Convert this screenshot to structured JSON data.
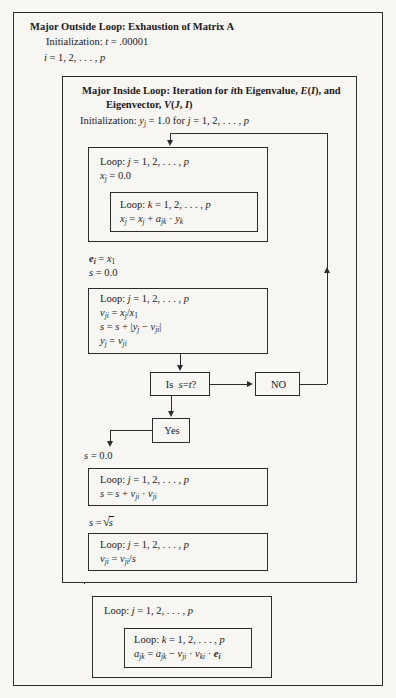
{
  "document": {
    "kind": "algorithm-flowchart",
    "background_color": "#f8f6f3",
    "line_color": "#2c2c2c"
  },
  "outside_loop": {
    "title": "Major Outside Loop: Exhaustion of Matrix A",
    "initialization": "Initialization: t = .00001",
    "index": "i = 1, 2, . . . , p"
  },
  "inside_loop": {
    "title_line1": "Major Inside Loop: Iteration for ith Eigenvalue, E(I), and",
    "title_line2": "Eigenvector, V(J, I)",
    "initialization": "Initialization: yⱼ = 1.0 for j = 1, 2, . . . , p"
  },
  "loop_box_1": {
    "line1": "Loop: j = 1, 2, . . . , p",
    "line2": "xⱼ = 0.0",
    "inner": {
      "line1": "Loop: k = 1, 2, . . . , p",
      "line2": "xⱼ = xⱼ + aⱼₖ · yₖ"
    }
  },
  "equations_after_loop_1": {
    "line1": "eᵢ = x₁",
    "line2": "s = 0.0"
  },
  "loop_box_2": {
    "line1": "Loop: j = 1, 2, . . . , p",
    "line2": "vⱼᵢ = xⱼ/x₁",
    "line3": "s = s + |yⱼ − vⱼᵢ|",
    "line4": "yⱼ = vⱼᵢ"
  },
  "decision": {
    "label_prefix": "Is",
    "label_condition": "s = t?"
  },
  "no_branch": {
    "label": "NO"
  },
  "yes_branch": {
    "label": "Yes",
    "reset": "s = 0.0"
  },
  "loop_box_3": {
    "line1": "Loop: j = 1, 2, . . . , p",
    "line2": "s = s + vⱼᵢ · vⱼᵢ"
  },
  "sqrt_step": {
    "prefix": "s =",
    "radicand": "s"
  },
  "loop_box_4": {
    "line1": "Loop: j = 1, 2, . . . , p",
    "line2": "vⱼᵢ = vⱼᵢ/s"
  },
  "bottom_loop": {
    "line1": "Loop: j = 1, 2, . . . , p",
    "inner": {
      "line1": "Loop: k = 1, 2, . . . , p",
      "line2": "aⱼₖ = aⱼₖ − vⱼᵢ · vₖᵢ · eᵢ"
    }
  }
}
